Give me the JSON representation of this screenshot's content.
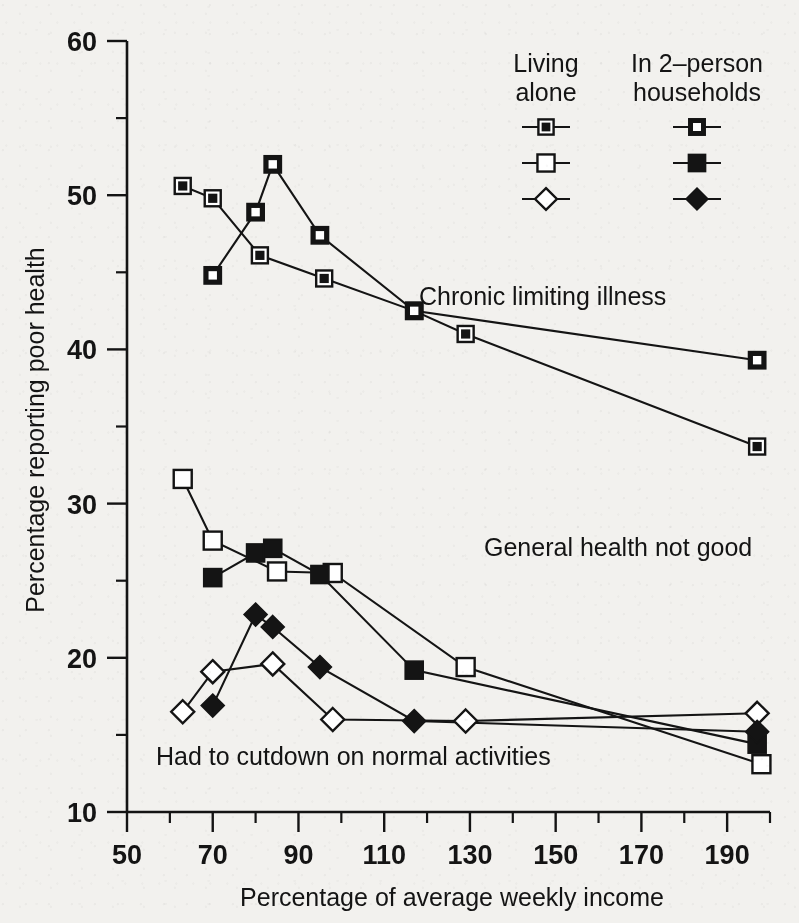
{
  "chart_data": {
    "type": "line",
    "title": "",
    "xlabel": "Percentage of average weekly income",
    "ylabel": "Percentage reporting poor health",
    "xlim": [
      50,
      200
    ],
    "ylim": [
      10,
      60
    ],
    "x_major_ticks": [
      50,
      70,
      90,
      110,
      130,
      150,
      170,
      190
    ],
    "x_minor_ticks": [
      60,
      80,
      100,
      120,
      140,
      160,
      180,
      200
    ],
    "y_major_ticks": [
      10,
      20,
      30,
      40,
      50,
      60
    ],
    "y_minor_ticks": [
      15,
      25,
      35,
      45,
      55
    ],
    "grid": false,
    "legend_position": "top-right-inside",
    "annotations": [
      {
        "text": "Chronic limiting illness",
        "x": 131,
        "y": 43.6
      },
      {
        "text": "General health not good",
        "x": 146,
        "y": 25.2
      },
      {
        "text": "Had to cutdown on normal activities",
        "x": 73,
        "y": 16.1
      }
    ],
    "series": [
      {
        "name": "Chronic limiting illness — living alone",
        "group": "Chronic limiting illness",
        "household": "Living alone",
        "marker": "square-dot",
        "points": [
          {
            "x": 63,
            "y": 50.6
          },
          {
            "x": 70,
            "y": 49.8
          },
          {
            "x": 81,
            "y": 46.1
          },
          {
            "x": 96,
            "y": 44.6
          },
          {
            "x": 117,
            "y": 42.5
          },
          {
            "x": 129,
            "y": 41.0
          },
          {
            "x": 197,
            "y": 33.7
          }
        ]
      },
      {
        "name": "Chronic limiting illness — in 2–person households",
        "group": "Chronic limiting illness",
        "household": "In 2–person households",
        "marker": "square-open-on-black",
        "points": [
          {
            "x": 70,
            "y": 44.8
          },
          {
            "x": 80,
            "y": 48.9
          },
          {
            "x": 84,
            "y": 52.0
          },
          {
            "x": 95,
            "y": 47.4
          },
          {
            "x": 117,
            "y": 42.5
          },
          {
            "x": 197,
            "y": 39.3
          }
        ]
      },
      {
        "name": "General health not good — living alone",
        "group": "General health not good",
        "household": "Living alone",
        "marker": "square-open",
        "points": [
          {
            "x": 63,
            "y": 31.6
          },
          {
            "x": 70,
            "y": 27.6
          },
          {
            "x": 85,
            "y": 25.6
          },
          {
            "x": 98,
            "y": 25.5
          },
          {
            "x": 129,
            "y": 19.4
          },
          {
            "x": 198,
            "y": 13.1
          }
        ]
      },
      {
        "name": "General health not good — in 2–person households",
        "group": "General health not good",
        "household": "In 2–person households",
        "marker": "square-filled",
        "points": [
          {
            "x": 70,
            "y": 25.2
          },
          {
            "x": 80,
            "y": 26.8
          },
          {
            "x": 84,
            "y": 27.1
          },
          {
            "x": 95,
            "y": 25.4
          },
          {
            "x": 117,
            "y": 19.2
          },
          {
            "x": 197,
            "y": 14.4
          }
        ]
      },
      {
        "name": "Had to cutdown on normal activities — living alone",
        "group": "Had to cutdown on normal activities",
        "household": "Living alone",
        "marker": "diamond-open",
        "points": [
          {
            "x": 63,
            "y": 16.5
          },
          {
            "x": 70,
            "y": 19.1
          },
          {
            "x": 84,
            "y": 19.6
          },
          {
            "x": 98,
            "y": 16.0
          },
          {
            "x": 129,
            "y": 15.9
          },
          {
            "x": 197,
            "y": 16.4
          }
        ]
      },
      {
        "name": "Had to cutdown on normal activities — in 2–person households",
        "group": "Had to cutdown on normal activities",
        "household": "In 2–person households",
        "marker": "diamond-filled",
        "points": [
          {
            "x": 70,
            "y": 16.9
          },
          {
            "x": 80,
            "y": 22.8
          },
          {
            "x": 84,
            "y": 22.0
          },
          {
            "x": 95,
            "y": 19.4
          },
          {
            "x": 117,
            "y": 15.9
          },
          {
            "x": 197,
            "y": 15.2
          }
        ]
      }
    ]
  },
  "axes": {
    "x_title": "Percentage of average weekly income",
    "y_title": "Percentage reporting poor health",
    "x_tick_labels": [
      "50",
      "70",
      "90",
      "110",
      "130",
      "150",
      "170",
      "190"
    ],
    "y_tick_labels": [
      "60",
      "50",
      "40",
      "30",
      "20",
      "10"
    ]
  },
  "legend": {
    "col1_title_line1": "Living",
    "col1_title_line2": "alone",
    "col2_title_line1": "In 2–person",
    "col2_title_line2": "households",
    "rows": [
      {
        "left_marker": "square-dot",
        "right_marker": "square-open-on-black"
      },
      {
        "left_marker": "square-open",
        "right_marker": "square-filled"
      },
      {
        "left_marker": "diamond-open",
        "right_marker": "diamond-filled"
      }
    ]
  },
  "annotations": {
    "chronic": "Chronic limiting illness",
    "general": "General health not good",
    "cutdown": "Had to cutdown on normal activities"
  },
  "colors": {
    "ink": "#141414",
    "paper": "#f2f1ee",
    "marker_fill_open": "#ffffff"
  }
}
